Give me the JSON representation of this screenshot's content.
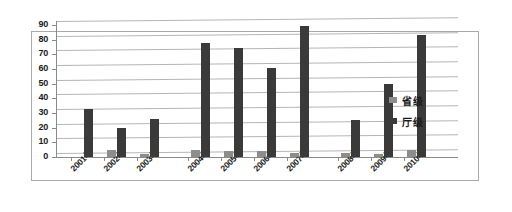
{
  "chart_data": {
    "type": "bar",
    "title": "",
    "xlabel": "",
    "ylabel": "",
    "ylim": [
      0,
      90
    ],
    "ytick_step": 10,
    "ytick_labels": [
      "90",
      "80",
      "70",
      "60",
      "50",
      "40",
      "30",
      "20",
      "10",
      "0"
    ],
    "grid": true,
    "legend_position": "right",
    "categories": [
      "2001年",
      "2002年",
      "2003年",
      "2004年",
      "2005年",
      "2006年",
      "2007年",
      "2008年",
      "2009年",
      "2010年"
    ],
    "series": [
      {
        "name": "省级",
        "color": "#8d8d8d",
        "values": [
          0,
          5,
          2,
          5,
          4,
          4,
          3,
          3,
          2,
          5
        ]
      },
      {
        "name": "厅级",
        "color": "#3a3a3a",
        "values": [
          33,
          20,
          26,
          78,
          74,
          61,
          89,
          25,
          50,
          83
        ]
      }
    ]
  },
  "legend": {
    "items": [
      {
        "label": "省级"
      },
      {
        "label": "厅级"
      }
    ]
  }
}
